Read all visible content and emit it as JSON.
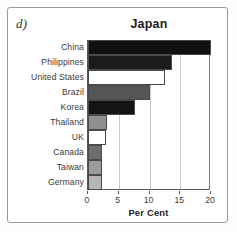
{
  "figure": {
    "panel_letter": "d)",
    "frame_color": "#9a9a9a",
    "background": "#ffffff"
  },
  "chart_data": {
    "type": "bar",
    "orientation": "horizontal",
    "title": "Japan",
    "xlabel": "Per Cent",
    "ylabel": "",
    "xlim": [
      0,
      20
    ],
    "xticks": [
      0,
      5,
      10,
      15,
      20
    ],
    "xtick_labels": [
      "0",
      "5",
      "10",
      "15",
      "20"
    ],
    "grid": "vertical",
    "legend": "none",
    "categories": [
      "China",
      "Philippines",
      "United States",
      "Brazil",
      "Korea",
      "Thailand",
      "UK",
      "Canada",
      "Taiwan",
      "Germany"
    ],
    "values": [
      20.0,
      13.6,
      12.6,
      10.0,
      7.7,
      3.1,
      3.0,
      2.3,
      2.2,
      2.2
    ],
    "bar_colors": [
      "#111111",
      "#1c1c1c",
      "#ffffff",
      "#555555",
      "#141414",
      "#8f8f8f",
      "#ffffff",
      "#6e6e6e",
      "#9b9b9b",
      "#b4b4b4"
    ],
    "bar_edge_color": "#4a4a4a",
    "axis_color": "#585858",
    "gridline_color": "#c9c9c9"
  }
}
